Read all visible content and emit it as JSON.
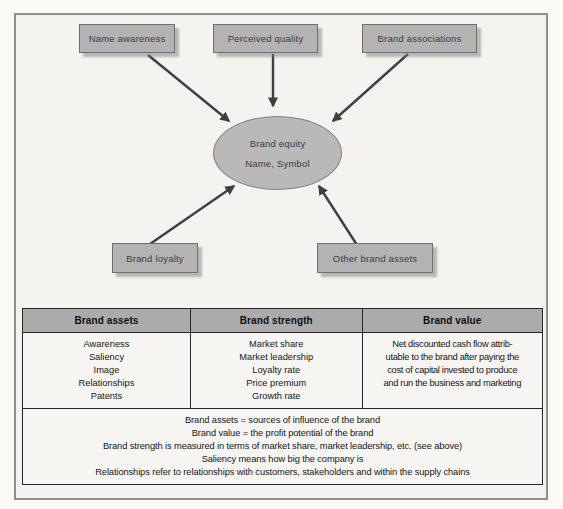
{
  "diagram": {
    "boxes": [
      {
        "label": "Name awareness"
      },
      {
        "label": "Perceived quality"
      },
      {
        "label": "Brand associations"
      },
      {
        "label": "Brand loyalty"
      },
      {
        "label": "Other brand assets"
      }
    ],
    "ellipse": {
      "line1": "Brand equity",
      "line2": "Name, Symbol"
    },
    "arrows": [
      {
        "from": "Name awareness",
        "to": "Brand equity"
      },
      {
        "from": "Perceived quality",
        "to": "Brand equity"
      },
      {
        "from": "Brand associations",
        "to": "Brand equity"
      },
      {
        "from": "Brand loyalty",
        "to": "Brand equity"
      },
      {
        "from": "Other brand assets",
        "to": "Brand equity"
      }
    ]
  },
  "table": {
    "headers": [
      "Brand assets",
      "Brand strength",
      "Brand value"
    ],
    "body": {
      "brand_assets": [
        "Awareness",
        "Saliency",
        "Image",
        "Relationships",
        "Patents"
      ],
      "brand_strength": [
        "Market share",
        "Market leadership",
        "Loyalty rate",
        "Price premium",
        "Growth rate"
      ],
      "brand_value_lines": [
        "Net discounted cash flow attrib-",
        "utable to the brand after paying the",
        "cost of capital invested to produce",
        "and run the business and marketing"
      ]
    },
    "notes": [
      "Brand assets = sources of influence of the brand",
      "Brand value = the profit potential of the brand",
      "Brand strength is measured in terms of market share, market leadership, etc. (see above)",
      "Saliency means how big the company is",
      "Relationships refer to relationships with customers, stakeholders and within the supply chains"
    ]
  },
  "colors": {
    "box_fill": "#b3b3b3",
    "box_border": "#6f6f6f",
    "ellipse_fill": "#b9b9b9",
    "header_fill": "#ababab",
    "arrow": "#3f3f3f",
    "table_border": "#262626",
    "frame_border": "#8f8e8a"
  }
}
